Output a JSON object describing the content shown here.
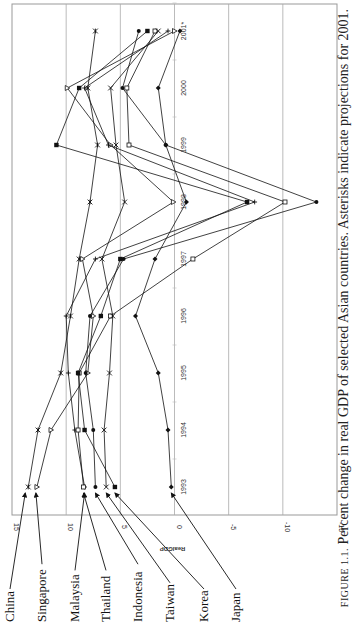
{
  "caption": {
    "figure_label": "FIGURE 1.1.",
    "text": "Percent change in real GDP of selected Asian countries. Asterisks indicate projections for 2001."
  },
  "chart_data": {
    "type": "line",
    "orientation": "rotated-90-ccw",
    "title": "",
    "xlabel": "",
    "ylabel": "RealGDP",
    "ylim": [
      -15,
      15
    ],
    "yticks": [
      "15",
      "10",
      "5",
      "0",
      "-5",
      "-10",
      "-15"
    ],
    "categories": [
      "1993",
      "1994",
      "1995",
      "1996",
      "1997",
      "1998",
      "1999",
      "2000",
      "2001*"
    ],
    "grid": true,
    "legend_position": "left (arrow labels)",
    "series": [
      {
        "name": "China",
        "marker": "asterisk",
        "values": [
          13.5,
          12.6,
          10.5,
          9.6,
          8.8,
          7.8,
          7.1,
          8.0,
          7.3
        ]
      },
      {
        "name": "Singapore",
        "marker": "triangle-open",
        "values": [
          12.7,
          11.4,
          8.0,
          7.5,
          8.5,
          0.1,
          5.9,
          9.9,
          0.0
        ]
      },
      {
        "name": "Malaysia",
        "marker": "plus",
        "values": [
          8.3,
          9.2,
          9.8,
          10.0,
          7.3,
          -7.4,
          6.1,
          8.3,
          0.6
        ]
      },
      {
        "name": "Thailand",
        "marker": "square",
        "values": [
          8.4,
          8.9,
          8.8,
          5.9,
          -1.7,
          -10.2,
          4.2,
          4.4,
          1.8
        ]
      },
      {
        "name": "Indonesia",
        "marker": "circle",
        "values": [
          7.3,
          7.5,
          8.2,
          7.8,
          4.7,
          -13.1,
          0.8,
          4.8,
          3.3
        ]
      },
      {
        "name": "Taiwan",
        "marker": "x",
        "values": [
          6.3,
          6.5,
          6.0,
          5.7,
          6.7,
          4.6,
          5.4,
          5.9,
          1.5
        ]
      },
      {
        "name": "Korea",
        "marker": "square-filled",
        "values": [
          5.5,
          8.3,
          8.9,
          6.8,
          5.0,
          -6.7,
          10.9,
          8.8,
          2.5
        ]
      },
      {
        "name": "Japan",
        "marker": "diamond",
        "values": [
          0.3,
          0.6,
          1.5,
          3.6,
          1.8,
          -1.1,
          0.8,
          1.5,
          -0.5
        ]
      }
    ]
  }
}
